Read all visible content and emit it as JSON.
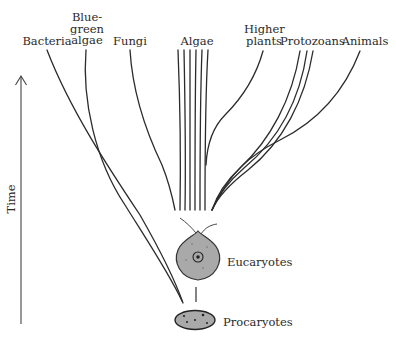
{
  "diagram": {
    "type": "phylogenetic-tree",
    "axis": {
      "label": "Time",
      "direction": "up"
    },
    "groups": [
      {
        "id": "bacteria",
        "label_lines": [
          "Bacteria"
        ]
      },
      {
        "id": "blue-green-algae",
        "label_lines": [
          "Blue-",
          "green",
          "algae"
        ]
      },
      {
        "id": "fungi",
        "label_lines": [
          "Fungi"
        ]
      },
      {
        "id": "algae",
        "label_lines": [
          "Algae"
        ]
      },
      {
        "id": "higher-plants",
        "label_lines": [
          "Higher",
          "plants"
        ]
      },
      {
        "id": "protozoans",
        "label_lines": [
          "Protozoans"
        ]
      },
      {
        "id": "animals",
        "label_lines": [
          "Animals"
        ]
      }
    ],
    "nodes": {
      "eucaryotes": "Eucaryotes",
      "procaryotes": "Procaryotes"
    },
    "colors": {
      "line": "#2b2b2b",
      "cell_fill": "#a9a9a9",
      "cell_stroke": "#333333",
      "background": "#ffffff"
    }
  }
}
